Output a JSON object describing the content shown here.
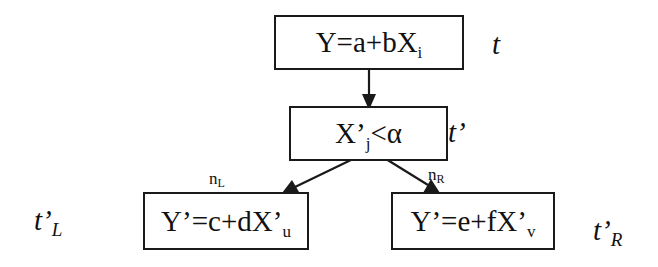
{
  "diagram": {
    "type": "regression-tree-split",
    "nodes": {
      "root": {
        "equation_main": "Y=a+bX",
        "equation_sub": "i",
        "label_main": "t",
        "label_sub": ""
      },
      "split": {
        "condition_main": "X’",
        "condition_sub": "j",
        "condition_tail": "<α",
        "label_main": "t’",
        "label_sub": ""
      },
      "left_child": {
        "equation_main": "Y’=c+dX’",
        "equation_sub": "u",
        "label_main": "t’",
        "label_sub": "L"
      },
      "right_child": {
        "equation_main": "Y’=e+fX’",
        "equation_sub": "v",
        "label_main": "t’",
        "label_sub": "R"
      }
    },
    "edges": [
      {
        "from": "root",
        "to": "split",
        "label_main": "",
        "label_sub": ""
      },
      {
        "from": "split",
        "to": "left_child",
        "label_main": "n",
        "label_sub": "L"
      },
      {
        "from": "split",
        "to": "right_child",
        "label_main": "n",
        "label_sub": "R"
      }
    ],
    "colors": {
      "stroke": "#1a1a1a",
      "background": "#ffffff",
      "text": "#111111"
    }
  }
}
